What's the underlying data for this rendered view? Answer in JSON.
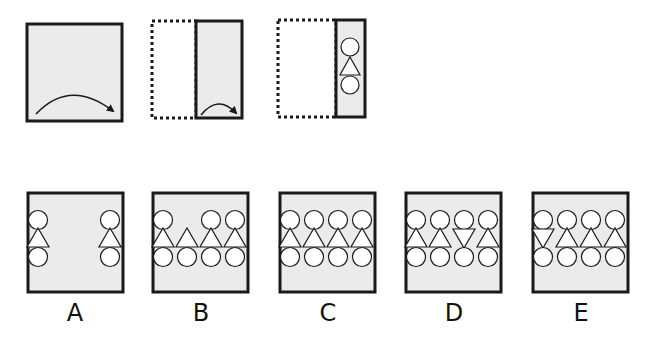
{
  "puzzle": {
    "steps": [
      {
        "name": "square-with-fold-arrow",
        "description": "square paper, arrow indicating fold left to right"
      },
      {
        "name": "folded-half",
        "description": "paper folded in half, arrow indicating second fold"
      },
      {
        "name": "folded-quarter-punched",
        "description": "paper folded into quarter with circle-triangle-circle punched"
      }
    ],
    "punch_pattern": [
      "circle",
      "triangle-up",
      "circle"
    ]
  },
  "options": [
    {
      "label": "A",
      "columns": [
        [
          "circle",
          "triangle-up",
          "circle"
        ],
        null,
        null,
        [
          "circle",
          "triangle-up",
          "circle"
        ]
      ],
      "col_x": [
        0,
        0,
        0,
        3
      ]
    },
    {
      "label": "B",
      "columns": [
        [
          "circle",
          "triangle-up",
          "circle"
        ],
        [
          null,
          "triangle-up",
          "circle"
        ],
        [
          "circle",
          "triangle-up",
          "circle"
        ],
        [
          "circle",
          "triangle-up",
          "circle"
        ]
      ]
    },
    {
      "label": "C",
      "columns": [
        [
          "circle",
          "triangle-up",
          "circle"
        ],
        [
          "circle",
          "triangle-up",
          "circle"
        ],
        [
          "circle",
          "triangle-up",
          "circle"
        ],
        [
          "circle",
          "triangle-up",
          "circle"
        ]
      ]
    },
    {
      "label": "D",
      "columns": [
        [
          "circle",
          "triangle-up",
          "circle"
        ],
        [
          "circle",
          "triangle-up",
          "circle"
        ],
        [
          "circle",
          "triangle-down",
          "circle"
        ],
        [
          "circle",
          "triangle-up",
          "circle"
        ]
      ]
    },
    {
      "label": "E",
      "columns": [
        [
          "circle",
          "triangle-down",
          "circle"
        ],
        [
          "circle",
          "triangle-up",
          "circle"
        ],
        [
          "circle",
          "triangle-up",
          "circle"
        ],
        [
          "circle",
          "triangle-up",
          "circle"
        ]
      ]
    }
  ],
  "colors": {
    "fill": "#ebebeb",
    "stroke": "#1a1a1a",
    "shape_fill": "#ffffff"
  }
}
